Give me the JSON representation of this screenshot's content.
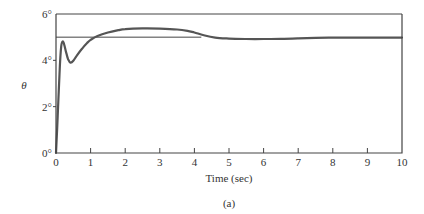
{
  "chart_data": {
    "type": "line",
    "title": "",
    "caption": "(a)",
    "xlabel": "Time (sec)",
    "ylabel": "θ",
    "xlim": [
      0,
      10
    ],
    "ylim": [
      0,
      6
    ],
    "xticks": [
      "0",
      "1",
      "2",
      "3",
      "4",
      "5",
      "6",
      "7",
      "8",
      "9",
      "10"
    ],
    "yticks": [
      "0°",
      "2°",
      "4°",
      "6°"
    ],
    "ytick_values": [
      0,
      2,
      4,
      6
    ],
    "grid": false,
    "reference_line": {
      "y": 5,
      "x_start": 0,
      "x_end": 4.2,
      "label": "5° setpoint"
    },
    "top_border_line": 6,
    "series": [
      {
        "name": "theta",
        "color": "#555555",
        "x": [
          0,
          0.05,
          0.1,
          0.15,
          0.2,
          0.25,
          0.3,
          0.35,
          0.42,
          0.5,
          0.6,
          0.75,
          0.9,
          1.0,
          1.2,
          1.5,
          1.8,
          2.0,
          2.5,
          3.0,
          3.5,
          3.8,
          4.0,
          4.3,
          4.6,
          5.0,
          5.5,
          6.0,
          6.5,
          7.0,
          7.5,
          8.0,
          9.0,
          10.0
        ],
        "values": [
          0,
          1.6,
          3.4,
          4.6,
          4.82,
          4.6,
          4.3,
          4.05,
          3.9,
          3.98,
          4.2,
          4.5,
          4.75,
          4.88,
          5.05,
          5.2,
          5.3,
          5.35,
          5.38,
          5.37,
          5.33,
          5.27,
          5.2,
          5.07,
          4.98,
          4.94,
          4.92,
          4.92,
          4.93,
          4.95,
          4.97,
          4.98,
          4.98,
          4.98
        ]
      }
    ]
  }
}
